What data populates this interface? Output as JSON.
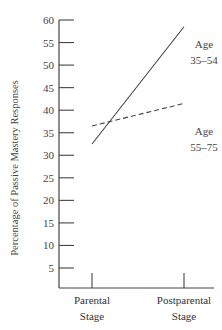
{
  "chart_data": {
    "type": "line",
    "title": "",
    "xlabel": "",
    "ylabel": "Percentage of Passive Mastery Responses",
    "categories": [
      "Parental Stage",
      "Postparental Stage"
    ],
    "category_lines": [
      [
        "Parental",
        "Stage"
      ],
      [
        "Postparental",
        "Stage"
      ]
    ],
    "yticks": [
      5,
      10,
      15,
      20,
      25,
      30,
      35,
      40,
      45,
      50,
      55,
      60
    ],
    "ylim": [
      0,
      60
    ],
    "grid": false,
    "legend_position": "inline labels at line ends",
    "series": [
      {
        "name": "Age 35–54",
        "label_lines": [
          "Age",
          "35–54"
        ],
        "style": "solid",
        "values": [
          32.5,
          58.5
        ]
      },
      {
        "name": "Age 55–75",
        "label_lines": [
          "Age",
          "55–75"
        ],
        "style": "dashed",
        "values": [
          36.5,
          41.5
        ]
      }
    ]
  }
}
